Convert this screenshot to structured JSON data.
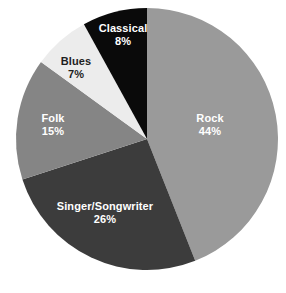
{
  "chart_data": {
    "type": "pie",
    "title": "",
    "subtitle": "",
    "xlabel": "",
    "ylabel": "",
    "legend_position": "none",
    "grid": false,
    "labels_inside_slices": true,
    "start_angle_deg": 0,
    "direction": "clockwise",
    "categories": [
      "Rock",
      "Singer/Songwriter",
      "Folk",
      "Blues",
      "Classical"
    ],
    "values": [
      44,
      26,
      15,
      7,
      8
    ],
    "value_suffix": "%",
    "total": 100,
    "slices": [
      {
        "label": "Rock",
        "value": 44,
        "value_text": "44%",
        "color": "#9a9a9a",
        "text_color": "#ffffff",
        "start_deg": 0,
        "end_deg": 158.4,
        "label_x": 210,
        "label_y": 125
      },
      {
        "label": "Singer/Songwriter",
        "value": 26,
        "value_text": "26%",
        "color": "#3c3c3c",
        "text_color": "#ffffff",
        "start_deg": 158.4,
        "end_deg": 252.0,
        "label_x": 105,
        "label_y": 213
      },
      {
        "label": "Folk",
        "value": 15,
        "value_text": "15%",
        "color": "#858585",
        "text_color": "#ffffff",
        "start_deg": 252.0,
        "end_deg": 306.0,
        "label_x": 53,
        "label_y": 125
      },
      {
        "label": "Blues",
        "value": 7,
        "value_text": "7%",
        "color": "#ececec",
        "text_color": "#1e1e1e",
        "start_deg": 306.0,
        "end_deg": 331.2,
        "label_x": 76,
        "label_y": 68
      },
      {
        "label": "Classical",
        "value": 8,
        "value_text": "8%",
        "color": "#0a0a0a",
        "text_color": "#ffffff",
        "start_deg": 331.2,
        "end_deg": 360.0,
        "label_x": 123,
        "label_y": 35
      }
    ],
    "geometry": {
      "center_x": 147,
      "center_y": 139,
      "radius": 131
    },
    "background_color": "#ffffff"
  }
}
